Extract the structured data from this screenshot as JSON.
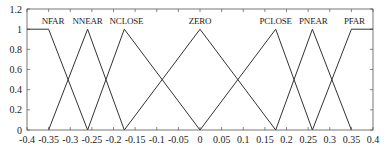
{
  "chart_data": {
    "type": "line",
    "title": "",
    "xlabel": "",
    "ylabel": "",
    "xlim": [
      -0.4,
      0.4
    ],
    "ylim": [
      0,
      1.2
    ],
    "grid": false,
    "legend": "inline labels above peaks",
    "x_ticks": [
      "-0.4",
      "-0.35",
      "-0.3",
      "-0.25",
      "-0.2",
      "-0.15",
      "-0.1",
      "-0.05",
      "0",
      "0.05",
      "0.1",
      "0.15",
      "0.2",
      "0.25",
      "0.3",
      "0.35",
      "0.4"
    ],
    "y_ticks": [
      "0",
      "0.2",
      "0.4",
      "0.6",
      "0.8",
      "1",
      "1.2"
    ],
    "series": [
      {
        "name": "NFAR",
        "points": [
          [
            -0.4,
            1
          ],
          [
            -0.35,
            1
          ],
          [
            -0.26,
            0
          ]
        ],
        "label_x": -0.34
      },
      {
        "name": "NNEAR",
        "points": [
          [
            -0.35,
            0
          ],
          [
            -0.26,
            1
          ],
          [
            -0.175,
            0
          ]
        ],
        "label_x": -0.26
      },
      {
        "name": "NCLOSE",
        "points": [
          [
            -0.26,
            0
          ],
          [
            -0.175,
            1
          ],
          [
            0,
            0
          ]
        ],
        "label_x": -0.17
      },
      {
        "name": "ZERO",
        "points": [
          [
            -0.175,
            0
          ],
          [
            0,
            1
          ],
          [
            0.175,
            0
          ]
        ],
        "label_x": 0.0
      },
      {
        "name": "PCLOSE",
        "points": [
          [
            0,
            0
          ],
          [
            0.175,
            1
          ],
          [
            0.26,
            0
          ]
        ],
        "label_x": 0.175
      },
      {
        "name": "PNEAR",
        "points": [
          [
            0.175,
            0
          ],
          [
            0.26,
            1
          ],
          [
            0.35,
            0
          ]
        ],
        "label_x": 0.262
      },
      {
        "name": "PFAR",
        "points": [
          [
            0.26,
            0
          ],
          [
            0.35,
            1
          ],
          [
            0.4,
            1
          ]
        ],
        "label_x": 0.357
      }
    ]
  },
  "style": {
    "line_color": "#333333",
    "axis_color": "#555555",
    "background": "#ffffff"
  }
}
